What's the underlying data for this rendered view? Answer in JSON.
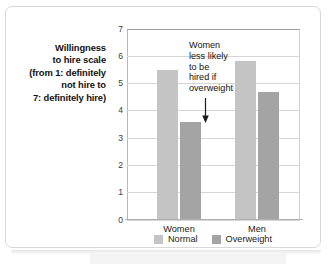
{
  "chart_data": {
    "type": "bar",
    "title": "",
    "xlabel": "",
    "ylabel": "Willingness to hire scale (from 1: definitely not hire to 7: definitely hire)",
    "ylim": [
      0,
      7
    ],
    "ytick_labels": [
      "7",
      "6",
      "5",
      "4",
      "3",
      "2",
      "1",
      "0"
    ],
    "ytick_values": [
      7,
      6,
      5,
      4,
      3,
      2,
      1,
      0
    ],
    "grid": true,
    "legend_position": "bottom-center",
    "categories": [
      "Women",
      "Men"
    ],
    "series": [
      {
        "name": "Normal",
        "color": "#c4c4c4",
        "values": [
          5.45,
          5.8
        ]
      },
      {
        "name": "Overweight",
        "color": "#a4a4a4",
        "values": [
          3.55,
          4.65
        ]
      }
    ],
    "annotations": [
      {
        "text": "Women less likely to be hired if overweight",
        "lines": [
          "Women",
          "less likely",
          "to be",
          "hired if",
          "overweight"
        ],
        "arrow": "down",
        "points_to": "Women / Overweight bar"
      }
    ]
  },
  "y_axis_title_lines": [
    "Willingness",
    "to hire scale",
    "(from 1: definitely",
    "not hire to",
    "7: definitely hire)"
  ],
  "colors": {
    "normal": "#c4c4c4",
    "overweight": "#a4a4a4",
    "grid": "#d5d5d5",
    "axis": "#b0b0b0",
    "text": "#111111",
    "card_border": "#d8d8d8"
  }
}
